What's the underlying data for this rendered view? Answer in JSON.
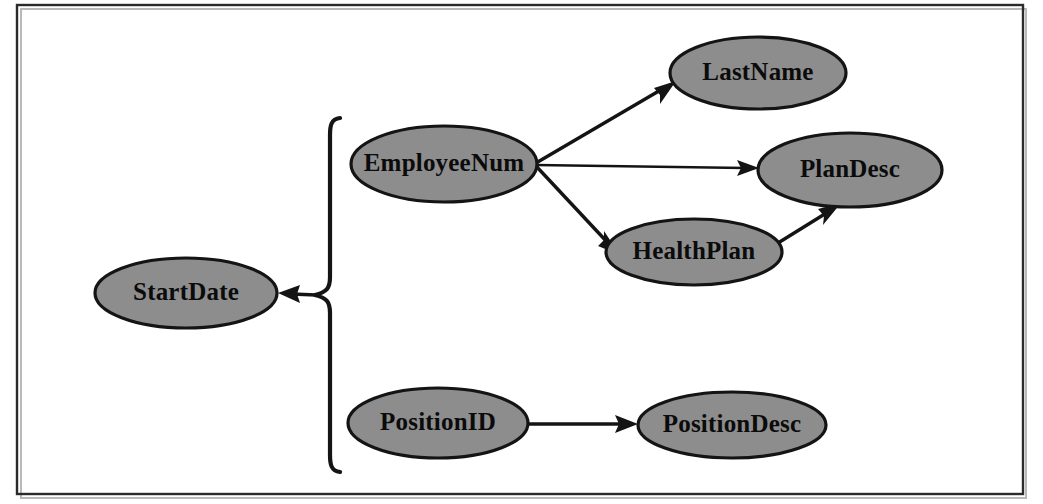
{
  "figure": {
    "frame": {
      "visible": true,
      "border_color": "#2b2b2b"
    },
    "background_color": "#ffffff",
    "node_fill_color": "#8d8d8d",
    "node_stroke_color": "#141414",
    "text_color": "#0b0b0b"
  },
  "nodes": [
    {
      "id": "startdate",
      "label": "StartDate",
      "cx": 186,
      "cy": 293,
      "rx": 91,
      "ry": 35
    },
    {
      "id": "employeenum",
      "label": "EmployeeNum",
      "cx": 444,
      "cy": 164,
      "rx": 93,
      "ry": 38
    },
    {
      "id": "lastname",
      "label": "LastName",
      "cx": 758,
      "cy": 73,
      "rx": 88,
      "ry": 36
    },
    {
      "id": "plandesc",
      "label": "PlanDesc",
      "cx": 850,
      "cy": 170,
      "rx": 92,
      "ry": 37
    },
    {
      "id": "healthplan",
      "label": "HealthPlan",
      "cx": 694,
      "cy": 252,
      "rx": 88,
      "ry": 33
    },
    {
      "id": "positionid",
      "label": "PositionID",
      "cx": 438,
      "cy": 423,
      "rx": 90,
      "ry": 35
    },
    {
      "id": "positiondesc",
      "label": "PositionDesc",
      "cx": 732,
      "cy": 425,
      "rx": 94,
      "ry": 33
    }
  ],
  "edges": [
    {
      "id": "employeenum-to-lastname",
      "from": "EmployeeNum",
      "to": "LastName",
      "arrow": "to"
    },
    {
      "id": "employeenum-to-plandesc",
      "from": "EmployeeNum",
      "to": "PlanDesc",
      "arrow": "to"
    },
    {
      "id": "employeenum-to-healthplan",
      "from": "EmployeeNum",
      "to": "HealthPlan",
      "arrow": "to"
    },
    {
      "id": "healthplan-to-plandesc",
      "from": "HealthPlan",
      "to": "PlanDesc",
      "arrow": "to"
    },
    {
      "id": "positionid-to-positiondesc",
      "from": "PositionID",
      "to": "PositionDesc",
      "arrow": "to"
    },
    {
      "id": "brace-to-startdate",
      "from": "brace",
      "to": "StartDate",
      "arrow": "to"
    }
  ],
  "brace": {
    "id": "grouping-brace",
    "orientation": "left-pointing",
    "top_y": 118,
    "bottom_y": 470,
    "tip_y": 295,
    "stem_x": 330,
    "tip_x": 292,
    "groups": [
      "EmployeeNum",
      "PositionID"
    ]
  }
}
